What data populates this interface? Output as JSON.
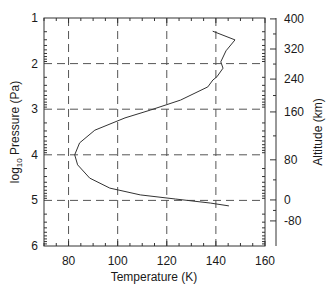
{
  "chart_data": {
    "type": "line",
    "title": "",
    "xlabel": "Temperature (K)",
    "ylabel": "log10 Pressure (Pa)",
    "ylabel_parts": {
      "base": "log",
      "sub": "10",
      "rest": " Pressure (Pa)"
    },
    "y2label": "Altitude (km)",
    "xlim": [
      70,
      160
    ],
    "ylim": [
      1,
      6
    ],
    "y_inverted": true,
    "grid": "dashed at major ticks",
    "legend": null,
    "x_ticks": [
      80,
      100,
      120,
      140,
      160
    ],
    "y_ticks": [
      1,
      2,
      3,
      4,
      5,
      6
    ],
    "y2_ticks": [
      {
        "label": "400",
        "logP": 1.02
      },
      {
        "label": "320",
        "logP": 1.68
      },
      {
        "label": "240",
        "logP": 2.34
      },
      {
        "label": "160",
        "logP": 3.06
      },
      {
        "label": "80",
        "logP": 4.11
      },
      {
        "label": "0",
        "logP": 4.99
      },
      {
        "label": "-80",
        "logP": 5.45
      }
    ],
    "series": [
      {
        "name": "Temperature profile",
        "color": "#333333",
        "points": [
          {
            "T": 138.7,
            "logP": 1.29
          },
          {
            "T": 147.8,
            "logP": 1.48
          },
          {
            "T": 144.1,
            "logP": 1.72
          },
          {
            "T": 142.0,
            "logP": 1.96
          },
          {
            "T": 142.9,
            "logP": 2.1
          },
          {
            "T": 140.4,
            "logP": 2.29
          },
          {
            "T": 138.8,
            "logP": 2.36
          },
          {
            "T": 136.7,
            "logP": 2.51
          },
          {
            "T": 125.6,
            "logP": 2.8
          },
          {
            "T": 113.3,
            "logP": 3.02
          },
          {
            "T": 103.0,
            "logP": 3.19
          },
          {
            "T": 90.7,
            "logP": 3.46
          },
          {
            "T": 84.5,
            "logP": 3.74
          },
          {
            "T": 82.5,
            "logP": 4.0
          },
          {
            "T": 83.7,
            "logP": 4.22
          },
          {
            "T": 88.6,
            "logP": 4.51
          },
          {
            "T": 96.8,
            "logP": 4.73
          },
          {
            "T": 109.2,
            "logP": 4.88
          },
          {
            "T": 123.5,
            "logP": 4.97
          },
          {
            "T": 137.9,
            "logP": 5.06
          },
          {
            "T": 145.3,
            "logP": 5.12
          }
        ]
      }
    ]
  },
  "colors": {
    "axis": "#333333",
    "grid": "#555555",
    "line": "#333333",
    "text": "#1a1a1a"
  }
}
